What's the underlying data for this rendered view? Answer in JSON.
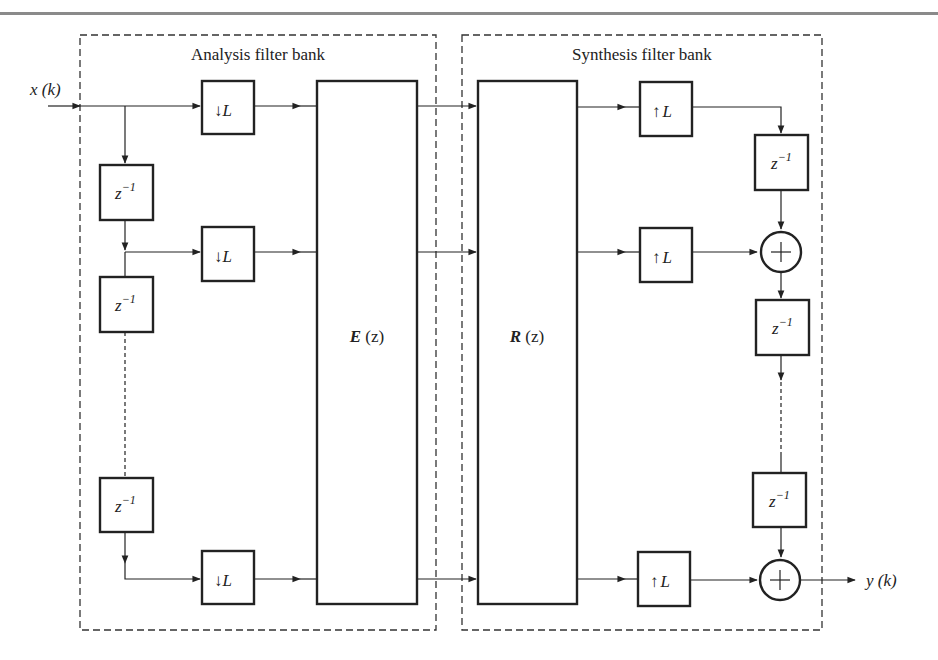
{
  "diagram": {
    "type": "block-diagram",
    "groups": {
      "analysis": {
        "title": "Analysis filter bank"
      },
      "synthesis": {
        "title": "Synthesis filter bank"
      }
    },
    "signals": {
      "input": "x (k)",
      "output": "y (k)"
    },
    "blocks": {
      "delay_label": "z",
      "delay_exponent": "−1",
      "downsample_arrow": "↓",
      "upsample_arrow": "↑",
      "factor": "L",
      "adder_symbol": "+",
      "analysis_matrix": {
        "bold": "E",
        "arg": " (z)"
      },
      "synthesis_matrix": {
        "bold": "R",
        "arg": " (z)"
      }
    },
    "analysis_branches": [
      {
        "id": "branch-0",
        "has_delay_before": false
      },
      {
        "id": "branch-1",
        "has_delay_before": true
      },
      {
        "id": "branch-last",
        "has_delay_before": true
      }
    ],
    "synthesis_branches": [
      {
        "id": "branch-0",
        "followed_by": "delay"
      },
      {
        "id": "branch-1",
        "followed_by": "adder"
      },
      {
        "id": "branch-last",
        "followed_by": "adder-output"
      }
    ],
    "colors": {
      "stroke": "#222222",
      "dashed_border": "#333333",
      "top_rule": "#8a8a8a",
      "background": "#ffffff"
    }
  }
}
